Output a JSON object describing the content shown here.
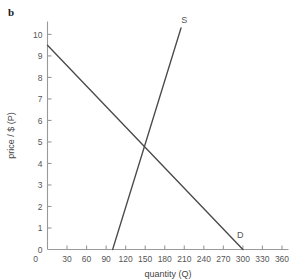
{
  "figure": {
    "panel_label": "b",
    "background": "#ffffff",
    "axis_color": "#999999",
    "curve_color": "#4a4a4a",
    "text_color": "#555555"
  },
  "chart_data": {
    "type": "line",
    "title": "",
    "subtitle": "",
    "xlabel": "quantity (Q)",
    "ylabel": "price / $ (P)",
    "xlim": [
      0,
      370
    ],
    "ylim": [
      0,
      10.6
    ],
    "xticks": [
      0,
      30,
      60,
      90,
      120,
      150,
      180,
      210,
      240,
      270,
      300,
      330,
      360
    ],
    "yticks": [
      0,
      1,
      2,
      3,
      4,
      5,
      6,
      7,
      8,
      9,
      10
    ],
    "xtick_labels": [
      "0",
      "30",
      "60",
      "90",
      "120",
      "150",
      "180",
      "210",
      "240",
      "270",
      "300",
      "330",
      "360"
    ],
    "ytick_labels": [
      "0",
      "1",
      "2",
      "3",
      "4",
      "5",
      "6",
      "7",
      "8",
      "9",
      "10"
    ],
    "grid": false,
    "legend": "none",
    "series": [
      {
        "name": "D",
        "label": "D",
        "label_point": {
          "x": 296,
          "y": 0.55
        },
        "points": [
          {
            "x": 0,
            "y": 9.5
          },
          {
            "x": 300,
            "y": 0
          }
        ]
      },
      {
        "name": "S",
        "label": "S",
        "label_point": {
          "x": 210,
          "y": 10.55
        },
        "points": [
          {
            "x": 100,
            "y": 0
          },
          {
            "x": 205,
            "y": 10.3
          }
        ]
      }
    ],
    "annotations": [
      {
        "name": "equilibrium",
        "x": 150,
        "y": 5,
        "text": ""
      }
    ]
  }
}
